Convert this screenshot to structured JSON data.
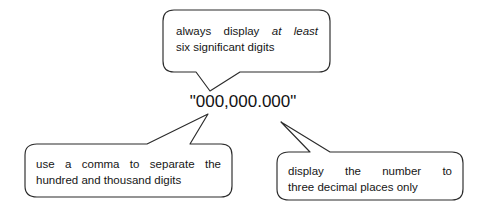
{
  "diagram": {
    "background_color": "#ffffff",
    "stroke_color": "#2b2b2b",
    "text_color": "#161616",
    "center_label": {
      "text": "\"000,000.000\"",
      "name": "format-string"
    },
    "callouts": [
      {
        "id": "top",
        "position": "top-center",
        "line1_prefix": "always display ",
        "line1_emphasis": "at least",
        "line2": "six significant digits",
        "full_text": "always display at least six significant digits",
        "points_to": "whole-number"
      },
      {
        "id": "bottom-left",
        "position": "bottom-left",
        "line1": "use a comma to separate the",
        "line2": "hundred and thousand digits",
        "full_text": "use a comma to separate the hundred and thousand digits",
        "points_to": "comma-separator"
      },
      {
        "id": "bottom-right",
        "position": "bottom-right",
        "line1": "display the number to",
        "line2": "three decimal places only",
        "full_text": "display the number to three decimal places only",
        "points_to": "decimal-places"
      }
    ]
  }
}
